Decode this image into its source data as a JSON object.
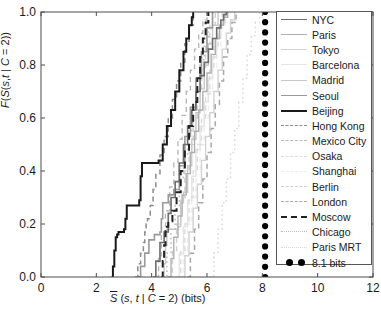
{
  "figure": {
    "background": "#ffffff",
    "axis_color": "#4d4d4d",
    "text_color": "#1a1a1a"
  },
  "axes": {
    "x_label_html": "S&#772; (s, t | C = 2) (bits)",
    "y_label_html": "F(S&#772;(s,t | C = 2))",
    "x_ticks": [
      "0",
      "2",
      "4",
      "6",
      "8",
      "10",
      "12"
    ],
    "x_tick_values": [
      0,
      2,
      4,
      6,
      8,
      10,
      12
    ],
    "y_ticks": [
      "0.0",
      "0.2",
      "0.4",
      "0.6",
      "0.8",
      "1.0"
    ],
    "y_tick_values": [
      0.0,
      0.2,
      0.4,
      0.6,
      0.8,
      1.0
    ],
    "xlim": [
      0,
      12
    ],
    "ylim": [
      0,
      1
    ],
    "grid": false
  },
  "legend": {
    "position": "right-inside",
    "entries": [
      {
        "label": "NYC",
        "color": "#6e6e6e",
        "style": "solid",
        "width": 1.6
      },
      {
        "label": "Paris",
        "color": "#b0b0b0",
        "style": "solid",
        "width": 1.4
      },
      {
        "label": "Tokyo",
        "color": "#d2d2d2",
        "style": "solid",
        "width": 1.4
      },
      {
        "label": "Barcelona",
        "color": "#e4e4e4",
        "style": "solid",
        "width": 1.4
      },
      {
        "label": "Madrid",
        "color": "#c8c8c8",
        "style": "solid",
        "width": 1.4
      },
      {
        "label": "Seoul",
        "color": "#9a9a9a",
        "style": "solid",
        "width": 1.6
      },
      {
        "label": "Beijing",
        "color": "#1a1a1a",
        "style": "solid",
        "width": 2.0
      },
      {
        "label": "Hong Kong",
        "color": "#8c8c8c",
        "style": "dashed",
        "width": 1.5
      },
      {
        "label": "Mexico City",
        "color": "#b8b8b8",
        "style": "dashed",
        "width": 1.4
      },
      {
        "label": "Osaka",
        "color": "#dcdcdc",
        "style": "dashed",
        "width": 1.4
      },
      {
        "label": "Shanghai",
        "color": "#ededed",
        "style": "dashed",
        "width": 1.4
      },
      {
        "label": "Berlin",
        "color": "#cfcfcf",
        "style": "dashed",
        "width": 1.4
      },
      {
        "label": "London",
        "color": "#a8a8a8",
        "style": "dashed",
        "width": 1.5
      },
      {
        "label": "Moscow",
        "color": "#222222",
        "style": "dashed",
        "width": 2.0
      },
      {
        "label": "Chicago",
        "color": "#bdbdbd",
        "style": "dotted",
        "width": 1.5
      },
      {
        "label": "Paris MRT",
        "color": "#d8d8d8",
        "style": "dotted",
        "width": 1.5
      },
      {
        "label": "8.1 bits",
        "color": "#000000",
        "style": "dots",
        "width": 3.0
      }
    ]
  },
  "chart_data": {
    "type": "line",
    "title": "",
    "xlabel": "S̄ (s, t | C = 2) (bits)",
    "ylabel": "F(S̄(s,t | C = 2))",
    "xlim": [
      0,
      12
    ],
    "ylim": [
      0,
      1
    ],
    "reference_line": {
      "label": "8.1 bits",
      "x": 8.1,
      "marker": "filled-circle",
      "color": "#000000"
    },
    "series": [
      {
        "name": "NYC",
        "color": "#6e6e6e",
        "style": "solid",
        "x": [
          4.05,
          4.15,
          4.3,
          4.45,
          4.6,
          4.7,
          4.85,
          5.0,
          5.15,
          5.3,
          5.45,
          5.6,
          5.75,
          5.9,
          6.05,
          6.2,
          6.35,
          6.5,
          6.6,
          6.7
        ],
        "y": [
          0.0,
          0.06,
          0.13,
          0.17,
          0.24,
          0.3,
          0.36,
          0.43,
          0.5,
          0.57,
          0.63,
          0.7,
          0.76,
          0.81,
          0.86,
          0.9,
          0.94,
          0.97,
          0.99,
          1.0
        ]
      },
      {
        "name": "Paris",
        "color": "#b0b0b0",
        "style": "solid",
        "x": [
          4.6,
          4.7,
          4.8,
          4.95,
          5.1,
          5.25,
          5.4,
          5.55,
          5.7,
          5.85,
          6.0,
          6.15,
          6.3,
          6.45,
          6.6,
          6.75
        ],
        "y": [
          0.0,
          0.07,
          0.15,
          0.23,
          0.31,
          0.39,
          0.47,
          0.55,
          0.63,
          0.7,
          0.77,
          0.84,
          0.9,
          0.95,
          0.98,
          1.0
        ]
      },
      {
        "name": "Tokyo",
        "color": "#d2d2d2",
        "style": "solid",
        "x": [
          5.1,
          5.2,
          5.35,
          5.5,
          5.65,
          5.8,
          5.95,
          6.1,
          6.25,
          6.4,
          6.55,
          6.7,
          6.85,
          7.0
        ],
        "y": [
          0.0,
          0.08,
          0.17,
          0.26,
          0.35,
          0.44,
          0.53,
          0.62,
          0.7,
          0.78,
          0.86,
          0.92,
          0.97,
          1.0
        ]
      },
      {
        "name": "Barcelona",
        "color": "#e4e4e4",
        "style": "solid",
        "x": [
          4.85,
          5.0,
          5.15,
          5.3,
          5.45,
          5.6,
          5.75,
          5.9,
          6.05,
          6.2,
          6.35,
          6.5,
          6.65
        ],
        "y": [
          0.0,
          0.09,
          0.19,
          0.29,
          0.38,
          0.48,
          0.57,
          0.66,
          0.75,
          0.83,
          0.9,
          0.96,
          1.0
        ]
      },
      {
        "name": "Madrid",
        "color": "#c8c8c8",
        "style": "solid",
        "x": [
          4.35,
          4.45,
          4.5,
          4.55,
          4.95,
          5.05,
          5.15,
          5.3,
          5.45,
          5.6,
          5.75,
          5.9,
          6.05,
          6.2,
          6.4
        ],
        "y": [
          0.0,
          0.05,
          0.12,
          0.18,
          0.19,
          0.28,
          0.32,
          0.42,
          0.52,
          0.62,
          0.71,
          0.8,
          0.88,
          0.95,
          1.0
        ]
      },
      {
        "name": "Seoul",
        "color": "#9a9a9a",
        "style": "solid",
        "x": [
          3.5,
          3.6,
          3.75,
          3.9,
          4.1,
          4.3,
          4.35,
          4.4,
          4.6,
          4.8,
          5.0,
          5.2,
          5.4,
          5.6,
          5.8,
          6.0,
          6.2
        ],
        "y": [
          0.0,
          0.04,
          0.09,
          0.14,
          0.16,
          0.17,
          0.22,
          0.28,
          0.31,
          0.33,
          0.42,
          0.53,
          0.64,
          0.75,
          0.85,
          0.94,
          1.0
        ]
      },
      {
        "name": "Beijing",
        "color": "#1a1a1a",
        "style": "solid",
        "x": [
          2.55,
          2.6,
          2.65,
          2.7,
          2.75,
          2.8,
          3.0,
          3.05,
          3.1,
          3.55,
          3.6,
          3.65,
          4.25,
          4.4,
          4.55,
          4.7,
          4.85,
          5.0,
          5.15,
          5.25,
          5.35,
          5.45,
          5.5
        ],
        "y": [
          0.0,
          0.04,
          0.1,
          0.15,
          0.16,
          0.17,
          0.18,
          0.22,
          0.27,
          0.29,
          0.38,
          0.43,
          0.44,
          0.5,
          0.57,
          0.63,
          0.7,
          0.78,
          0.85,
          0.9,
          0.95,
          0.98,
          1.0
        ]
      },
      {
        "name": "Hong Kong",
        "color": "#8c8c8c",
        "style": "dashed",
        "x": [
          3.4,
          3.5,
          3.6,
          3.7,
          3.75,
          3.8,
          3.85,
          3.95,
          4.05,
          4.15,
          4.3,
          4.45,
          4.6,
          4.75,
          4.9,
          5.05,
          5.2,
          5.35,
          5.5
        ],
        "y": [
          0.0,
          0.05,
          0.09,
          0.13,
          0.17,
          0.2,
          0.22,
          0.27,
          0.33,
          0.39,
          0.46,
          0.53,
          0.6,
          0.67,
          0.74,
          0.81,
          0.88,
          0.95,
          1.0
        ]
      },
      {
        "name": "Mexico City",
        "color": "#b8b8b8",
        "style": "dashed",
        "x": [
          4.15,
          4.25,
          4.35,
          4.5,
          4.65,
          4.8,
          4.95,
          5.1,
          5.25,
          5.4,
          5.55,
          5.7,
          5.85,
          6.0
        ],
        "y": [
          0.0,
          0.08,
          0.16,
          0.25,
          0.34,
          0.43,
          0.52,
          0.61,
          0.7,
          0.78,
          0.86,
          0.92,
          0.97,
          1.0
        ]
      },
      {
        "name": "Osaka",
        "color": "#dcdcdc",
        "style": "dashed",
        "x": [
          4.9,
          5.05,
          5.2,
          5.35,
          5.5,
          5.65,
          5.8,
          5.95,
          6.1,
          6.25,
          6.4,
          6.55
        ],
        "y": [
          0.0,
          0.1,
          0.2,
          0.3,
          0.4,
          0.5,
          0.6,
          0.69,
          0.78,
          0.87,
          0.94,
          1.0
        ]
      },
      {
        "name": "Shanghai",
        "color": "#ededed",
        "style": "dashed",
        "x": [
          5.0,
          5.15,
          5.3,
          5.45,
          5.6,
          5.75,
          5.9,
          6.05,
          6.2,
          6.35,
          6.5,
          6.65
        ],
        "y": [
          0.0,
          0.1,
          0.2,
          0.3,
          0.4,
          0.5,
          0.6,
          0.7,
          0.79,
          0.87,
          0.94,
          1.0
        ]
      },
      {
        "name": "Berlin",
        "color": "#cfcfcf",
        "style": "dashed",
        "x": [
          4.6,
          4.75,
          4.9,
          5.05,
          5.2,
          5.35,
          5.5,
          5.65,
          5.8,
          5.95,
          6.1,
          6.3
        ],
        "y": [
          0.0,
          0.1,
          0.2,
          0.3,
          0.4,
          0.5,
          0.6,
          0.7,
          0.79,
          0.88,
          0.95,
          1.0
        ]
      },
      {
        "name": "London",
        "color": "#a8a8a8",
        "style": "dashed",
        "x": [
          5.3,
          5.4,
          5.55,
          5.7,
          5.85,
          6.0,
          6.15,
          6.3,
          6.45,
          6.6,
          6.75,
          6.9,
          7.05
        ],
        "y": [
          0.0,
          0.09,
          0.18,
          0.28,
          0.37,
          0.47,
          0.56,
          0.65,
          0.74,
          0.83,
          0.9,
          0.96,
          1.0
        ]
      },
      {
        "name": "Moscow",
        "color": "#222222",
        "style": "dashed",
        "x": [
          4.35,
          4.4,
          4.45,
          4.5,
          4.6,
          4.75,
          4.9,
          5.05,
          5.2,
          5.35,
          5.5,
          5.65,
          5.75,
          5.85,
          5.95,
          6.05
        ],
        "y": [
          0.0,
          0.06,
          0.12,
          0.19,
          0.21,
          0.25,
          0.32,
          0.4,
          0.48,
          0.57,
          0.66,
          0.75,
          0.83,
          0.9,
          0.96,
          1.0
        ]
      },
      {
        "name": "Chicago",
        "color": "#bdbdbd",
        "style": "dotted",
        "x": [
          4.4,
          4.55,
          4.7,
          4.85,
          5.0,
          5.15,
          5.3,
          5.45,
          5.6,
          5.75,
          5.9,
          6.05,
          6.2
        ],
        "y": [
          0.0,
          0.09,
          0.18,
          0.27,
          0.37,
          0.46,
          0.55,
          0.64,
          0.73,
          0.82,
          0.9,
          0.96,
          1.0
        ]
      },
      {
        "name": "Paris MRT",
        "color": "#d8d8d8",
        "style": "dotted",
        "x": [
          6.1,
          6.25,
          6.4,
          6.55,
          6.7,
          6.85,
          7.0,
          7.15,
          7.3,
          7.45,
          7.6,
          7.75,
          7.9
        ],
        "y": [
          0.0,
          0.09,
          0.18,
          0.28,
          0.37,
          0.47,
          0.56,
          0.66,
          0.75,
          0.84,
          0.91,
          0.96,
          1.0
        ]
      }
    ]
  }
}
